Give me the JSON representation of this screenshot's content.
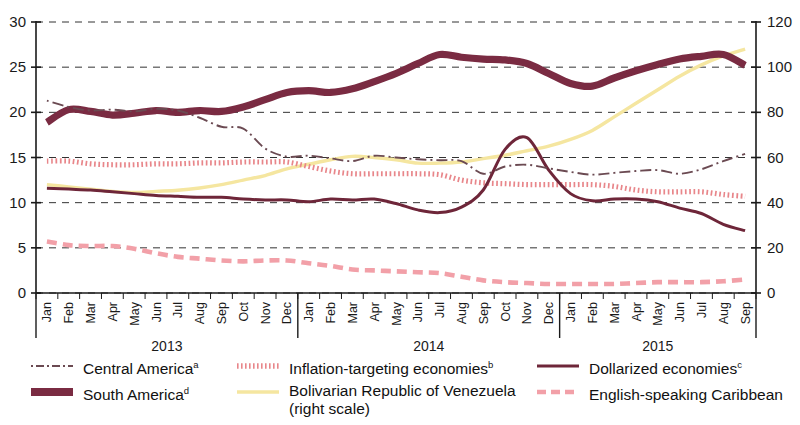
{
  "chart_data": {
    "type": "line",
    "title": "",
    "xlabel": "",
    "ylabel": "",
    "grid": true,
    "legend_position": "bottom",
    "x": [
      "Jan",
      "Feb",
      "Mar",
      "Apr",
      "May",
      "Jun",
      "Jul",
      "Aug",
      "Sep",
      "Oct",
      "Nov",
      "Dec",
      "Jan",
      "Feb",
      "Mar",
      "Apr",
      "May",
      "Jun",
      "Jul",
      "Aug",
      "Sep",
      "Oct",
      "Nov",
      "Dec",
      "Jan",
      "Feb",
      "Mar",
      "Apr",
      "May",
      "Jun",
      "Jul",
      "Aug",
      "Sep"
    ],
    "year_groups": [
      {
        "label": "2013",
        "start_index": 0,
        "end_index": 11
      },
      {
        "label": "2014",
        "start_index": 12,
        "end_index": 23
      },
      {
        "label": "2015",
        "start_index": 24,
        "end_index": 32
      }
    ],
    "left_axis": {
      "min": 0,
      "max": 30,
      "ticks": [
        0,
        5,
        10,
        15,
        20,
        25,
        30
      ]
    },
    "right_axis": {
      "min": 0,
      "max": 120,
      "ticks": [
        0,
        20,
        40,
        60,
        80,
        100,
        120
      ]
    },
    "series": [
      {
        "name": "Central America",
        "note": "a",
        "axis": "left",
        "style": "dashdot",
        "color": "#6b4a52",
        "values": [
          21.3,
          20.6,
          20.2,
          20.3,
          20.1,
          20.4,
          20.2,
          19.4,
          18.4,
          18.2,
          16.0,
          15.1,
          15.2,
          14.9,
          14.6,
          15.2,
          15.0,
          14.8,
          14.7,
          14.6,
          13.2,
          14.0,
          14.2,
          13.8,
          13.4,
          13.1,
          13.3,
          13.5,
          13.6,
          13.2,
          13.7,
          14.6,
          15.4
        ]
      },
      {
        "name": "Inflation-targeting economies",
        "note": "b",
        "axis": "left",
        "style": "dotted",
        "color": "#e8868a",
        "values": [
          14.6,
          14.6,
          14.3,
          14.2,
          14.2,
          14.3,
          14.3,
          14.4,
          14.4,
          14.5,
          14.5,
          14.5,
          14.0,
          13.5,
          13.2,
          13.2,
          13.2,
          13.2,
          13.1,
          12.5,
          12.2,
          12.1,
          12.0,
          12.0,
          12.0,
          12.0,
          11.8,
          11.4,
          11.2,
          11.2,
          11.2,
          10.9,
          10.7
        ]
      },
      {
        "name": "Dollarized economies",
        "note": "c",
        "axis": "left",
        "style": "solid",
        "color": "#6e2639",
        "values": [
          11.6,
          11.5,
          11.4,
          11.2,
          11.0,
          10.8,
          10.7,
          10.6,
          10.6,
          10.4,
          10.3,
          10.3,
          10.1,
          10.4,
          10.3,
          10.4,
          9.9,
          9.2,
          8.9,
          9.5,
          11.4,
          15.9,
          17.2,
          13.6,
          11.0,
          10.2,
          10.4,
          10.4,
          10.1,
          9.4,
          8.8,
          7.6,
          6.9
        ]
      },
      {
        "name": "South America",
        "note": "d",
        "axis": "left",
        "style": "thick",
        "color": "#7a2b42",
        "values": [
          18.9,
          20.3,
          20.1,
          19.7,
          19.9,
          20.2,
          20.0,
          20.2,
          20.1,
          20.6,
          21.4,
          22.2,
          22.4,
          22.2,
          22.6,
          23.4,
          24.3,
          25.4,
          26.4,
          26.1,
          25.9,
          25.8,
          25.4,
          24.3,
          23.2,
          22.9,
          23.8,
          24.6,
          25.3,
          25.9,
          26.2,
          26.4,
          25.2
        ]
      },
      {
        "name": "Bolivarian Republic of Venezuela",
        "note": "",
        "axis": "right",
        "style": "solid-thin",
        "color": "#f5e6a0",
        "scale_label": "(right scale)",
        "values": [
          48.0,
          47.0,
          46.0,
          45.0,
          44.5,
          45.0,
          45.5,
          46.5,
          48.0,
          50.0,
          52.0,
          55.0,
          57.0,
          59.0,
          60.5,
          60.0,
          59.0,
          57.5,
          57.5,
          58.0,
          59.5,
          61.0,
          63.0,
          65.0,
          68.0,
          72.0,
          78.0,
          84.0,
          90.0,
          96.0,
          101.0,
          105.0,
          108.0
        ]
      },
      {
        "name": "English-speaking Caribbean",
        "note": "",
        "axis": "left",
        "style": "dashed",
        "color": "#f2a0a8",
        "values": [
          5.7,
          5.3,
          5.2,
          5.2,
          4.9,
          4.4,
          4.0,
          3.8,
          3.6,
          3.5,
          3.6,
          3.6,
          3.3,
          3.0,
          2.6,
          2.5,
          2.4,
          2.3,
          2.2,
          1.8,
          1.4,
          1.2,
          1.1,
          1.0,
          1.0,
          1.0,
          1.0,
          1.1,
          1.2,
          1.2,
          1.2,
          1.3,
          1.5
        ]
      }
    ]
  },
  "legend": {
    "items": [
      {
        "label": "Central America",
        "note": "a",
        "key": "dashdot-key"
      },
      {
        "label": "Inflation-targeting economies",
        "note": "b",
        "key": "dotted-key"
      },
      {
        "label": "Dollarized economies",
        "note": "c",
        "key": "solid-key"
      },
      {
        "label": "South America",
        "note": "d",
        "key": "thick-key"
      },
      {
        "label": "Bolivarian Republic of Venezuela",
        "note": "",
        "key": "yellow-key",
        "sub": "(right scale)"
      },
      {
        "label": "English-speaking Caribbean",
        "note": "",
        "key": "dashed-key"
      }
    ]
  }
}
